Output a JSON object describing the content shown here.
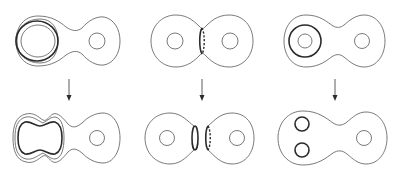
{
  "figure": {
    "columns": [
      {
        "id": "col-1",
        "top": "genus-2 surface with a thick curve bounding around the left handle, surrounded by a thin curve",
        "bottom": "thick curve pushed into a peanut shape inside the left lobe"
      },
      {
        "id": "col-2",
        "top": "genus-2 surface with separating curve at the neck (front solid, back dashed)",
        "bottom": "surface cut along neck curve into two pieces with boundary circles"
      },
      {
        "id": "col-3",
        "top": "genus-2 surface with thick circle around the left hole",
        "bottom": "left hole replaced by two small thick circles"
      }
    ],
    "arrows": [
      "down",
      "down",
      "down"
    ],
    "colors": {
      "thin_stroke": "#6a6a6a",
      "thick_stroke": "#2b2b2b",
      "background": "#ffffff"
    }
  }
}
